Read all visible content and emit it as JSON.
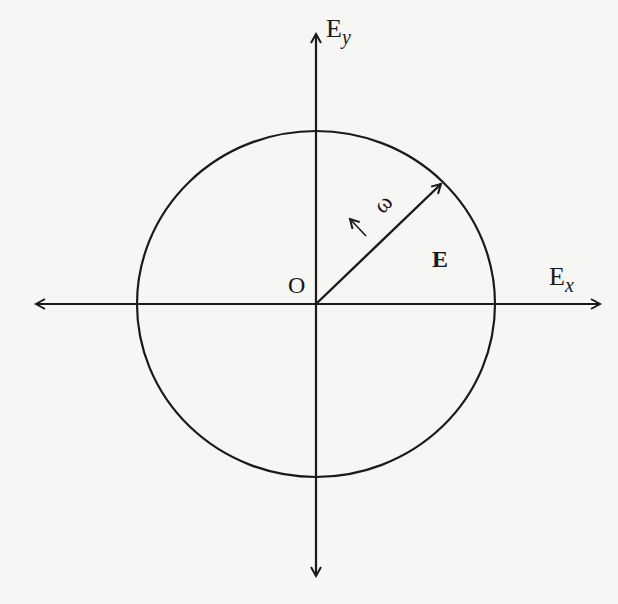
{
  "diagram": {
    "axes": {
      "x": {
        "label_main": "E",
        "label_sub": "x"
      },
      "y": {
        "label_main": "E",
        "label_sub": "y"
      }
    },
    "origin_label": "O",
    "vector_label": "E",
    "rotation_label": "↑ ω",
    "colors": {
      "ink": "#1a1a1a",
      "background": "#f6f6f4"
    }
  }
}
